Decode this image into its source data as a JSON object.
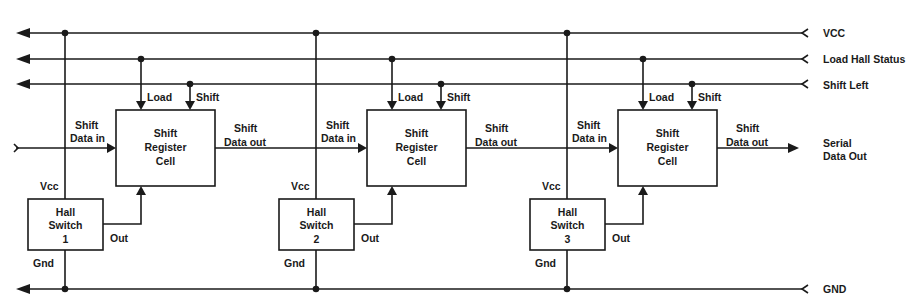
{
  "diagram": {
    "type": "block-diagram",
    "title": "",
    "rails": [
      {
        "id": "vcc",
        "label": "VCC",
        "y": 33
      },
      {
        "id": "load",
        "label": "Load Hall Status",
        "y": 59
      },
      {
        "id": "shift",
        "label": "Shift Left",
        "y": 84
      },
      {
        "id": "gnd",
        "label": "GND",
        "y": 289
      }
    ],
    "serial_out": {
      "line1": "Serial",
      "line2": "Data Out"
    },
    "stages": [
      {
        "hall": {
          "line1": "Hall",
          "line2": "Switch",
          "line3": "1"
        },
        "cell": {
          "line1": "Shift",
          "line2": "Register",
          "line3": "Cell"
        },
        "labels": {
          "load": "Load",
          "shift": "Shift",
          "data_in_1": "Shift",
          "data_in_2": "Data in",
          "data_out_1": "Shift",
          "data_out_2": "Data out",
          "vcc": "Vcc",
          "gnd": "Gnd",
          "out": "Out"
        }
      },
      {
        "hall": {
          "line1": "Hall",
          "line2": "Switch",
          "line3": "2"
        },
        "cell": {
          "line1": "Shift",
          "line2": "Register",
          "line3": "Cell"
        },
        "labels": {
          "load": "Load",
          "shift": "Shift",
          "data_in_1": "Shift",
          "data_in_2": "Data in",
          "data_out_1": "Shift",
          "data_out_2": "Data out",
          "vcc": "Vcc",
          "gnd": "Gnd",
          "out": "Out"
        }
      },
      {
        "hall": {
          "line1": "Hall",
          "line2": "Switch",
          "line3": "3"
        },
        "cell": {
          "line1": "Shift",
          "line2": "Register",
          "line3": "Cell"
        },
        "labels": {
          "load": "Load",
          "shift": "Shift",
          "data_in_1": "Shift",
          "data_in_2": "Data in",
          "data_out_1": "Shift",
          "data_out_2": "Data out",
          "vcc": "Vcc",
          "gnd": "Gnd",
          "out": "Out"
        }
      }
    ]
  }
}
